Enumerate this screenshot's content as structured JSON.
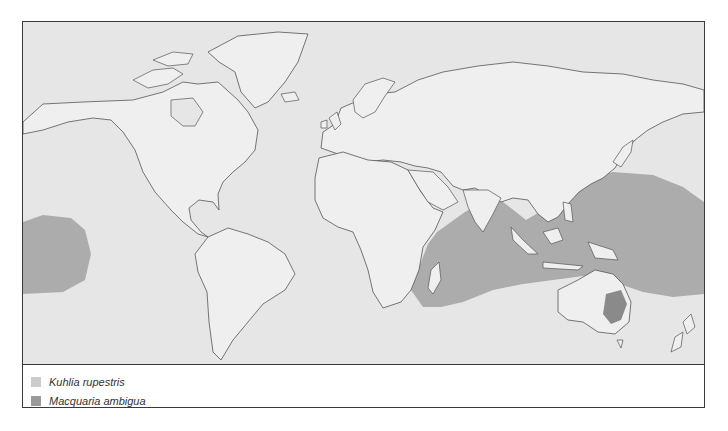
{
  "map": {
    "type": "species distribution map",
    "projection": "world",
    "ocean_color": "#e6e6e6",
    "land_color": "#efefef",
    "coastline_color": "#555555"
  },
  "legend": {
    "items": [
      {
        "label": "Kuhlia rupestris",
        "color": "#cccccc"
      },
      {
        "label": "Macquaria ambigua",
        "color": "#9a9a9a"
      }
    ]
  },
  "ranges": [
    {
      "species": "Kuhlia rupestris",
      "region": "Indo-Pacific (East Africa to central Pacific)",
      "color": "#a9a9a9"
    },
    {
      "species": "Kuhlia rupestris",
      "region": "Central Pacific (Hawaii area)",
      "color": "#a9a9a9"
    },
    {
      "species": "Macquaria ambigua",
      "region": "Murray-Darling basin, SE Australia",
      "color": "#8a8a8a"
    }
  ]
}
